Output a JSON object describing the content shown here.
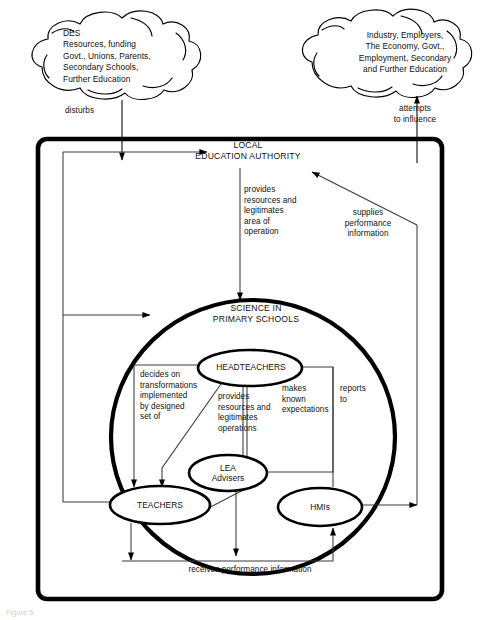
{
  "figure": {
    "caption": "Figure 5"
  },
  "colors": {
    "ink": "#000000",
    "thin_line": "#3a3a3a",
    "background": "#ffffff"
  },
  "clouds": [
    {
      "id": "des-cloud",
      "lines": "DES\nResources, funding\nGovt., Unions, Parents,\nSecondary Schools,\nFurther Education",
      "text": "DES Resources, funding Govt., Unions, Parents, Secondary Schools, Further Education"
    },
    {
      "id": "environment-cloud",
      "lines": "Industry, Employers,\nThe Economy, Govt.,\nEmployment, Secondary\nand Further Education",
      "text": "Industry, Employers, The Economy, Govt., Employment, Secondary and Further Education"
    }
  ],
  "nodes": {
    "lea": "LOCAL\nEDUCATION AUTHORITY",
    "system": "SCIENCE IN\nPRIMARY SCHOOLS",
    "headteachers": "HEADTEACHERS",
    "lea_advisers": "LEA\nAdvisers",
    "teachers": "TEACHERS",
    "hmis": "HMIs"
  },
  "edge_labels": {
    "disturbs": "disturbs",
    "attempts_to_influence": "attempts\nto influence",
    "provides_resources_lea": "provides\nresources and\nlegitimates\narea of\noperation",
    "supplies_performance_information": "supplies\nperformance\ninformation",
    "decides_on_transformations": "decides on\ntransformations\nimplemented\nby designed\nset of",
    "provides_resources_head": "provides\nresources and\nlegitimates\noperations",
    "makes_known_expectations": "makes\nknown\nexpectations",
    "reports_to": "reports\nto",
    "receives_performance_information": "receives performance information"
  }
}
